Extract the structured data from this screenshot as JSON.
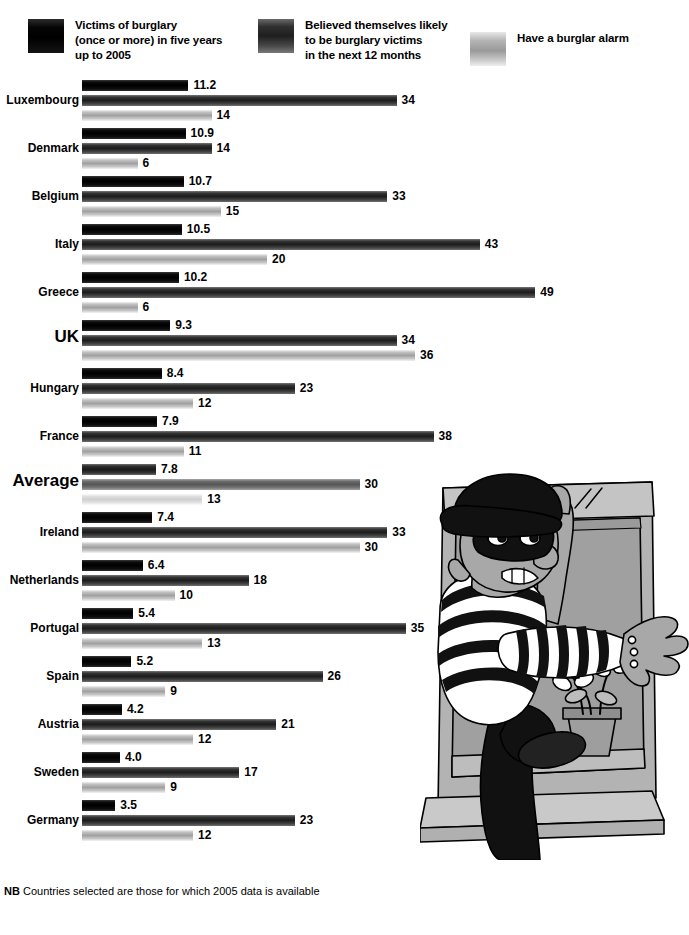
{
  "legend": {
    "items": [
      {
        "id": "victims",
        "label": "Victims of burglary\n(once or more) in five years\nup to 2005",
        "swatch": "victims-swatch",
        "color": "#000000"
      },
      {
        "id": "believed",
        "label": "Believed themselves likely\nto be burglary victims\nin the next 12 months",
        "swatch": "believed-swatch",
        "color": "#2b2b2b"
      },
      {
        "id": "alarm",
        "label": "Have a burglar alarm",
        "swatch": "alarm-swatch",
        "color": "#a8a8a8"
      }
    ]
  },
  "footnote": {
    "prefix": "NB",
    "text": " Countries selected are those for which 2005 data is available"
  },
  "illustration": {
    "name": "cartoon-burglar-climbing-through-window",
    "alt": "Cartoon burglar in black cap, eye mask and striped shirt climbing through an open window with a potted plant on the sill"
  },
  "chart_data": {
    "type": "bar",
    "orientation": "horizontal",
    "title": "",
    "xlabel": "",
    "ylabel": "",
    "grid": false,
    "legend_position": "top",
    "categories": [
      "Luxembourg",
      "Denmark",
      "Belgium",
      "Italy",
      "Greece",
      "UK",
      "Hungary",
      "France",
      "Average",
      "Ireland",
      "Netherlands",
      "Portugal",
      "Spain",
      "Austria",
      "Sweden",
      "Germany"
    ],
    "emphasised_categories": [
      "UK",
      "Average"
    ],
    "series": [
      {
        "name": "Victims of burglary (once or more) in five years up to 2005",
        "unit": "%",
        "scale_px_per_unit": 9.5,
        "values": [
          11.2,
          10.9,
          10.7,
          10.5,
          10.2,
          9.3,
          8.4,
          7.9,
          7.8,
          7.4,
          6.4,
          5.4,
          5.2,
          4.2,
          4.0,
          3.5
        ],
        "labels": [
          "11.2",
          "10.9",
          "10.7",
          "10.5",
          "10.2",
          "9.3",
          "8.4",
          "7.9",
          "7.8",
          "7.4",
          "6.4",
          "5.4",
          "5.2",
          "4.2",
          "4.0",
          "3.5"
        ]
      },
      {
        "name": "Believed themselves likely to be burglary victims in the next 12 months",
        "unit": "%",
        "scale_px_per_unit": 9.25,
        "values": [
          34,
          14,
          33,
          43,
          49,
          34,
          23,
          38,
          30,
          33,
          18,
          35,
          26,
          21,
          17,
          23
        ],
        "labels": [
          "34",
          "14",
          "33",
          "43",
          "49",
          "34",
          "23",
          "38",
          "30",
          "33",
          "18",
          "35",
          "26",
          "21",
          "17",
          "23"
        ]
      },
      {
        "name": "Have a burglar alarm",
        "unit": "%",
        "scale_px_per_unit": 9.25,
        "values": [
          14,
          6,
          15,
          20,
          6,
          36,
          12,
          11,
          13,
          30,
          10,
          13,
          9,
          12,
          9,
          12
        ],
        "labels": [
          "14",
          "6",
          "15",
          "20",
          "6",
          "36",
          "12",
          "11",
          "13",
          "30",
          "10",
          "13",
          "9",
          "12",
          "9",
          "12"
        ]
      }
    ]
  }
}
